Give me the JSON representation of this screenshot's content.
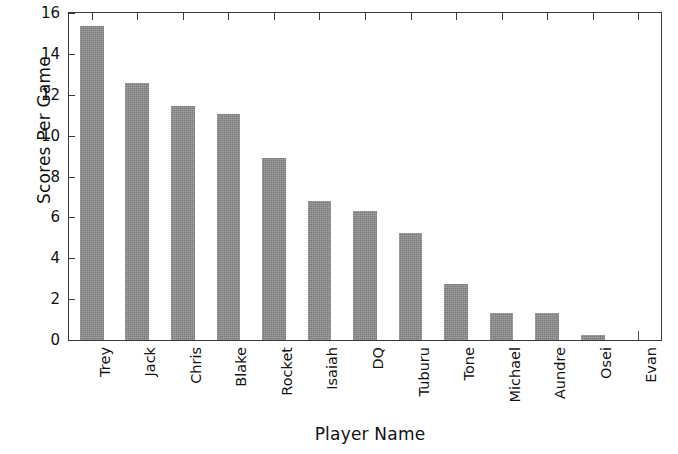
{
  "chart_data": {
    "type": "bar",
    "title": "",
    "xlabel": "Player Name",
    "ylabel": "Scores Per Game",
    "categories": [
      "Trey",
      "Jack",
      "Chris",
      "Blake",
      "Rocket",
      "Isaiah",
      "DQ",
      "Tuburu",
      "Tone",
      "Michael",
      "Aundre",
      "Osei",
      "Evan"
    ],
    "values": [
      15.35,
      12.6,
      11.45,
      11.05,
      8.9,
      6.8,
      6.3,
      5.25,
      2.75,
      1.3,
      1.3,
      0.25,
      0
    ],
    "ylim": [
      0,
      16
    ],
    "yticks": [
      0,
      2,
      4,
      6,
      8,
      10,
      12,
      14,
      16
    ],
    "ytick_labels": [
      "0",
      "2",
      "4",
      "6",
      "8",
      "10",
      "12",
      "14",
      "16"
    ],
    "grid": false,
    "legend": null,
    "bar_color": "#8a8a8a",
    "axis_color": "#3a3a3a",
    "background": "#ffffff"
  }
}
